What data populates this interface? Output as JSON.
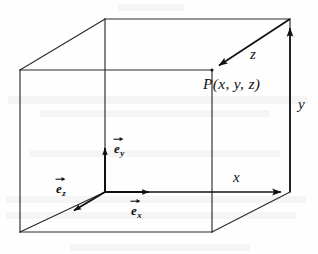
{
  "figure": {
    "kind": "3d-cartesian-coordinate-cube",
    "background_color": "#fefefe",
    "line_color": "#2b2b2b",
    "axis_color": "#111111",
    "width": 318,
    "height": 254
  },
  "labels": {
    "point": "P(x, y, z)",
    "axis_x": "x",
    "axis_y": "y",
    "axis_z": "z",
    "unit_x_base": "e",
    "unit_x_sub": "x",
    "unit_y_base": "e",
    "unit_y_sub": "y",
    "unit_z_base": "e",
    "unit_z_sub": "z"
  },
  "geometry": {
    "origin": {
      "x": 105,
      "y": 192
    },
    "vertices": {
      "front_bottom_left": {
        "x": 105,
        "y": 192
      },
      "front_bottom_right": {
        "x": 290,
        "y": 192
      },
      "front_top_left": {
        "x": 105,
        "y": 19
      },
      "front_top_right": {
        "x": 290,
        "y": 19
      },
      "back_bottom_left": {
        "x": 20,
        "y": 232
      },
      "back_bottom_right": {
        "x": 212,
        "y": 232
      },
      "back_top_left": {
        "x": 20,
        "y": 70
      },
      "back_top_right": {
        "x": 212,
        "y": 70
      }
    },
    "point_P": {
      "x": 212,
      "y": 70
    }
  },
  "arrows": {
    "x_axis": {
      "from": {
        "x": 105,
        "y": 192
      },
      "to": {
        "x": 290,
        "y": 192
      }
    },
    "y_axis": {
      "from": {
        "x": 290,
        "y": 192
      },
      "to": {
        "x": 290,
        "y": 19
      }
    },
    "z_axis": {
      "from": {
        "x": 290,
        "y": 19
      },
      "to": {
        "x": 212,
        "y": 70
      }
    },
    "unit_x": {
      "from": {
        "x": 105,
        "y": 192
      },
      "to": {
        "x": 157,
        "y": 192
      }
    },
    "unit_y": {
      "from": {
        "x": 105,
        "y": 192
      },
      "to": {
        "x": 105,
        "y": 140
      }
    },
    "unit_z": {
      "from": {
        "x": 105,
        "y": 192
      },
      "to": {
        "x": 68,
        "y": 214
      }
    }
  }
}
